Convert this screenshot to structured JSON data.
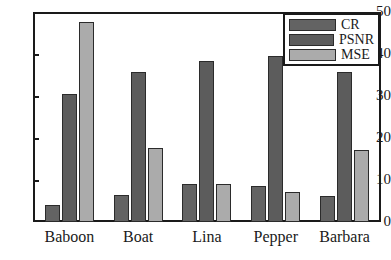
{
  "chart_data": {
    "type": "bar",
    "title": "",
    "xlabel": "",
    "ylabel": "",
    "ylim": [
      0,
      50
    ],
    "yticks": [
      0,
      10,
      20,
      30,
      40,
      50
    ],
    "grid": false,
    "legend_position": "top-right",
    "categories": [
      "Baboon",
      "Boat",
      "Lina",
      "Pepper",
      "Barbara"
    ],
    "series": [
      {
        "name": "CR",
        "color": "#636363",
        "values": [
          4.0,
          6.5,
          9.1,
          8.5,
          6.1
        ]
      },
      {
        "name": "PSNR",
        "color": "#5c5c5c",
        "values": [
          30.5,
          35.8,
          38.3,
          39.5,
          35.7
        ]
      },
      {
        "name": "MSE",
        "color": "#ababab",
        "values": [
          47.7,
          17.6,
          9.1,
          7.2,
          17.2
        ]
      }
    ]
  },
  "axis": {
    "ytick_labels": [
      "50",
      "40",
      "30",
      "20",
      "10",
      "0"
    ]
  },
  "legend": {
    "entries": [
      {
        "label": "CR"
      },
      {
        "label": "PSNR"
      },
      {
        "label": "MSE"
      }
    ]
  }
}
